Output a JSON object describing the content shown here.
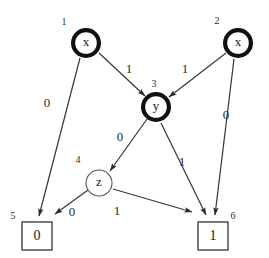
{
  "figure": {
    "background_color": "#ffffff",
    "ink_color": "#1a1a1a",
    "width": 269,
    "height": 258
  },
  "nodes": [
    {
      "id": "n1",
      "index": "1",
      "label": "x",
      "shape": "double-circle",
      "cx": 86,
      "cy": 43,
      "r": 15,
      "index_x": 64,
      "index_y": 23
    },
    {
      "id": "n2",
      "index": "2",
      "label": "x",
      "shape": "double-circle",
      "cx": 238,
      "cy": 43,
      "r": 15,
      "index_x": 217,
      "index_y": 22
    },
    {
      "id": "n3",
      "index": "3",
      "label": "y",
      "shape": "double-circle",
      "cx": 156,
      "cy": 107,
      "r": 15,
      "index_x": 154,
      "index_y": 85
    },
    {
      "id": "n4",
      "index": "4",
      "label": "z",
      "shape": "circle",
      "cx": 99,
      "cy": 183,
      "r": 13,
      "index_x": 78,
      "index_y": 161
    }
  ],
  "terminals": [
    {
      "id": "t5",
      "index": "5",
      "label": "0",
      "x": 22,
      "y": 222,
      "w": 30,
      "h": 28,
      "index_x": 13,
      "index_y": 217
    },
    {
      "id": "t6",
      "index": "6",
      "label": "1",
      "x": 198,
      "y": 222,
      "w": 30,
      "h": 28,
      "index_x": 233,
      "index_y": 217
    }
  ],
  "edges": [
    {
      "id": "e1",
      "from": "n1",
      "to": "t5",
      "label": "0",
      "label_x": 47,
      "label_y": 104,
      "x1": 80,
      "y1": 58,
      "x2": 39,
      "y2": 216
    },
    {
      "id": "e2",
      "from": "n1",
      "to": "n3",
      "label": "1",
      "label_x": 129,
      "label_y": 70,
      "x1": 99,
      "y1": 53,
      "x2": 145,
      "y2": 96
    },
    {
      "id": "e3",
      "from": "n2",
      "to": "n3",
      "label": "1",
      "label_x": 185,
      "label_y": 70,
      "x1": 226,
      "y1": 53,
      "x2": 169,
      "y2": 97
    },
    {
      "id": "e4",
      "from": "n2",
      "to": "t6",
      "label": "0",
      "label_x": 226,
      "label_y": 116,
      "x1": 234,
      "y1": 59,
      "x2": 215,
      "y2": 215
    },
    {
      "id": "e5",
      "from": "n3",
      "to": "n4",
      "label": "0",
      "label_x": 120,
      "label_y": 138,
      "x1": 147,
      "y1": 119,
      "x2": 110,
      "y2": 171
    },
    {
      "id": "e6",
      "from": "n3",
      "to": "t6",
      "label": "1",
      "label_x": 182,
      "label_y": 163,
      "x1": 161,
      "y1": 123,
      "x2": 206,
      "y2": 215
    },
    {
      "id": "e7",
      "from": "n4",
      "to": "t5",
      "label": "0",
      "label_x": 72,
      "label_y": 213,
      "x1": 88,
      "y1": 190,
      "x2": 55,
      "y2": 214
    },
    {
      "id": "e8",
      "from": "n4",
      "to": "t6",
      "label": "1",
      "label_x": 117,
      "label_y": 212,
      "x1": 113,
      "y1": 189,
      "x2": 192,
      "y2": 212
    }
  ]
}
